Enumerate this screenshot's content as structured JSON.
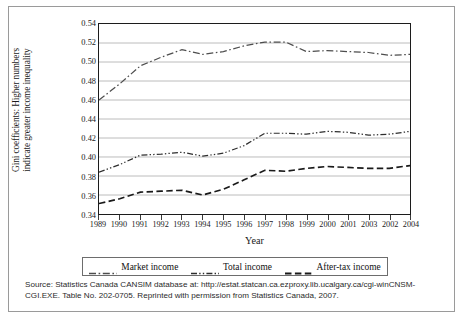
{
  "figure": {
    "ylabel_line1": "Gini coefficients: Higher numbers",
    "ylabel_line2": "indicate greater income inequality",
    "xlabel": "Year",
    "source_line1": "Source: Statistics Canada CANSIM database at: http://estat.statcan.ca.ezproxy.lib.ucalgary.ca/cgi-winCNSM-",
    "source_line2": "CGI.EXE. Table No. 202-0705. Reprinted with permission from Statistics Canada, 2007."
  },
  "chart_data": {
    "type": "line",
    "title": "",
    "xlabel": "Year",
    "ylabel": "Gini coefficients: Higher numbers indicate greater income inequality",
    "ylim": [
      0.34,
      0.54
    ],
    "ytick_labels": [
      "0.34",
      "0.36",
      "0.38",
      "0.40",
      "0.42",
      "0.44",
      "0.46",
      "0.48",
      "0.50",
      "0.52",
      "0.54"
    ],
    "ytick_values": [
      0.34,
      0.36,
      0.38,
      0.4,
      0.42,
      0.44,
      0.46,
      0.48,
      0.5,
      0.52,
      0.54
    ],
    "grid": true,
    "grid_orientation": "horizontal",
    "legend_position": "bottom",
    "categories": [
      "1989",
      "1990",
      "1991",
      "1992",
      "1993",
      "1994",
      "1995",
      "1996",
      "1997",
      "1998",
      "1999",
      "2000",
      "2001",
      "2003",
      "2002",
      "2004"
    ],
    "series": [
      {
        "name": "Market income",
        "linestyle": "dash-dot",
        "color": "#4d4d4d",
        "values": [
          0.46,
          0.477,
          0.496,
          0.505,
          0.513,
          0.508,
          0.511,
          0.517,
          0.521,
          0.521,
          0.511,
          0.512,
          0.511,
          0.51,
          0.507,
          0.508
        ]
      },
      {
        "name": "Total income",
        "linestyle": "dash-dot-dot",
        "color": "#2e2e2e",
        "values": [
          0.384,
          0.392,
          0.402,
          0.403,
          0.405,
          0.401,
          0.404,
          0.412,
          0.425,
          0.425,
          0.424,
          0.427,
          0.426,
          0.423,
          0.424,
          0.427
        ]
      },
      {
        "name": "After-tax income",
        "linestyle": "dashed",
        "color": "#1a1a1a",
        "values": [
          0.351,
          0.356,
          0.363,
          0.364,
          0.365,
          0.36,
          0.366,
          0.376,
          0.386,
          0.385,
          0.388,
          0.39,
          0.389,
          0.388,
          0.388,
          0.391
        ]
      }
    ]
  }
}
